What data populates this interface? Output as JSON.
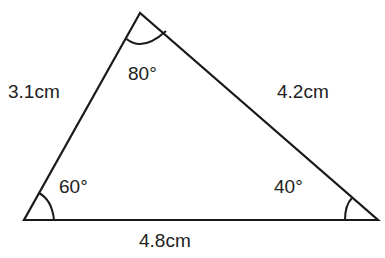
{
  "diagram": {
    "type": "triangle",
    "colors": {
      "stroke": "#1a1a1a",
      "text": "#222222",
      "background": "#ffffff"
    },
    "vertices": {
      "top": {
        "x": 140,
        "y": 13
      },
      "bottom_left": {
        "x": 24,
        "y": 220
      },
      "bottom_right": {
        "x": 378,
        "y": 220
      }
    },
    "sides": {
      "left": "3.1cm",
      "right": "4.2cm",
      "base": "4.8cm"
    },
    "angles": {
      "top": "80°",
      "bottom_left": "60°",
      "bottom_right": "40°"
    }
  }
}
